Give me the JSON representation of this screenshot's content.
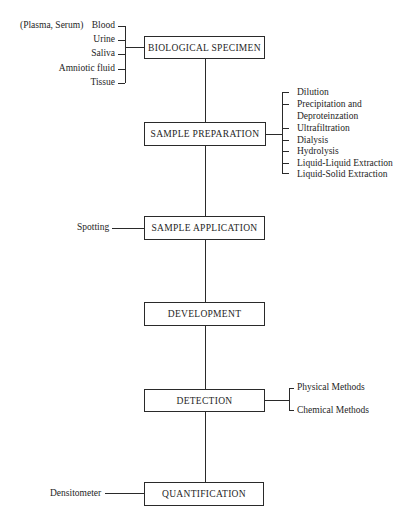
{
  "diagram": {
    "stages": [
      {
        "id": "biological-specimen",
        "label": "BIOLOGICAL SPECIMEN"
      },
      {
        "id": "sample-preparation",
        "label": "SAMPLE PREPARATION"
      },
      {
        "id": "sample-application",
        "label": "SAMPLE APPLICATION"
      },
      {
        "id": "development",
        "label": "DEVELOPMENT"
      },
      {
        "id": "detection",
        "label": "DETECTION"
      },
      {
        "id": "quantification",
        "label": "QUANTIFICATION"
      }
    ],
    "specimen_sources": {
      "prefix": "(Plasma, Serum)",
      "items": [
        "Blood",
        "Urine",
        "Saliva",
        "Amniotic fluid",
        "Tissue"
      ]
    },
    "preparation_methods": [
      "Dilution",
      "Precipitation and",
      "Deproteinzation",
      "Ultrafiltration",
      "Dialysis",
      "Hydrolysis",
      "Liquid-Liquid Extraction",
      "Liquid-Solid Extraction"
    ],
    "application_method": "Spotting",
    "detection_methods": [
      "Physical Methods",
      "Chemical Methods"
    ],
    "quantification_method": "Densitometer"
  }
}
